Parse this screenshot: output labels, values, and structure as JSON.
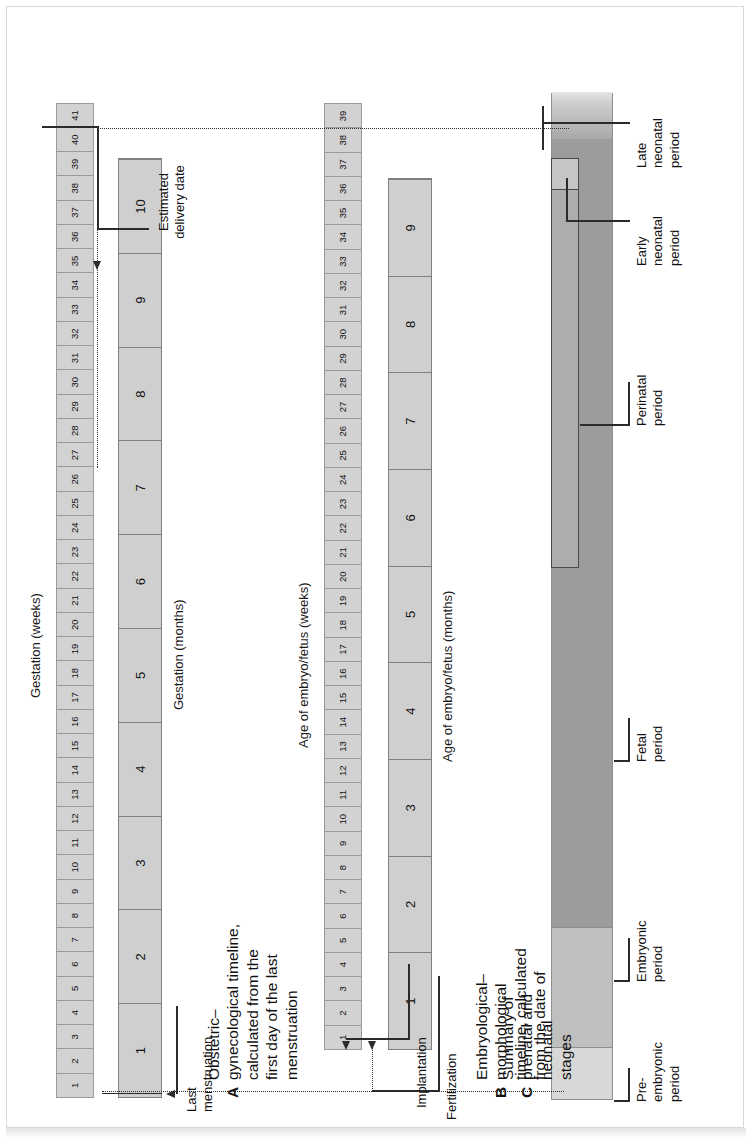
{
  "figure": {
    "title_a_letter": "A",
    "title_a": "Obstetric–\ngynecological timeline,\ncalculated from the\nfirst day of the last\nmenstruation",
    "title_b_letter": "B",
    "title_b": "Embryological–\nmorphological\ntimeline, calculated\nfrom the date of\nfertilization",
    "title_c_letter": "C",
    "title_c": "Summary of\nprenatal and\nneonatal\nstages"
  },
  "section_a": {
    "weeks_axis_label": "Gestation (weeks)",
    "months_axis_label": "Gestation (months)",
    "weeks": [
      "1",
      "2",
      "3",
      "4",
      "5",
      "6",
      "7",
      "8",
      "9",
      "10",
      "11",
      "12",
      "13",
      "14",
      "15",
      "16",
      "17",
      "18",
      "19",
      "20",
      "21",
      "22",
      "23",
      "24",
      "25",
      "26",
      "27",
      "28",
      "29",
      "30",
      "31",
      "32",
      "33",
      "34",
      "35",
      "36",
      "37",
      "38",
      "39",
      "40",
      "41"
    ],
    "months": [
      "1",
      "2",
      "3",
      "4",
      "5",
      "6",
      "7",
      "8",
      "9",
      "10"
    ],
    "callouts": {
      "last_menstruation": "Last\nmenstruation",
      "estimated_delivery": "Estimated\ndelivery date"
    }
  },
  "section_b": {
    "weeks_axis_label": "Age of embryo/fetus (weeks)",
    "months_axis_label": "Age of embryo/fetus (months)",
    "weeks": [
      "1",
      "2",
      "3",
      "4",
      "5",
      "6",
      "7",
      "8",
      "9",
      "10",
      "11",
      "12",
      "13",
      "14",
      "15",
      "16",
      "17",
      "18",
      "19",
      "20",
      "21",
      "22",
      "23",
      "24",
      "25",
      "26",
      "27",
      "28",
      "29",
      "30",
      "31",
      "32",
      "33",
      "34",
      "35",
      "36",
      "37",
      "38",
      "39"
    ],
    "months": [
      "1",
      "2",
      "3",
      "4",
      "5",
      "6",
      "7",
      "8",
      "9"
    ],
    "callouts": {
      "implantation": "Implantation",
      "fertilization": "Fertilization"
    }
  },
  "section_c": {
    "stages": [
      {
        "name": "pre-embryonic",
        "label": "Pre-\nembryonic\nperiod",
        "color": "#d8d8d8"
      },
      {
        "name": "embryonic",
        "label": "Embryonic\nperiod",
        "color": "#bcbcbc"
      },
      {
        "name": "fetal",
        "label": "Fetal\nperiod",
        "color": "#9a9a9a"
      },
      {
        "name": "perinatal",
        "label": "Perinatal\nperiod",
        "color": "#b4b4b4"
      },
      {
        "name": "early-neonatal",
        "label": "Early\nneonatal\nperiod",
        "color": "#c4c4c4"
      },
      {
        "name": "late-neonatal",
        "label": "Late\nneonatal\nperiod",
        "color": "#b8b8b8"
      }
    ]
  },
  "chart_data": {
    "type": "table",
    "series": [
      {
        "name": "Gestation (weeks)",
        "categories": [
          "1",
          "2",
          "3",
          "4",
          "5",
          "6",
          "7",
          "8",
          "9",
          "10",
          "11",
          "12",
          "13",
          "14",
          "15",
          "16",
          "17",
          "18",
          "19",
          "20",
          "21",
          "22",
          "23",
          "24",
          "25",
          "26",
          "27",
          "28",
          "29",
          "30",
          "31",
          "32",
          "33",
          "34",
          "35",
          "36",
          "37",
          "38",
          "39",
          "40",
          "41"
        ]
      },
      {
        "name": "Gestation (months)",
        "categories": [
          "1",
          "2",
          "3",
          "4",
          "5",
          "6",
          "7",
          "8",
          "9",
          "10"
        ]
      },
      {
        "name": "Age of embryo/fetus (weeks)",
        "categories": [
          "1",
          "2",
          "3",
          "4",
          "5",
          "6",
          "7",
          "8",
          "9",
          "10",
          "11",
          "12",
          "13",
          "14",
          "15",
          "16",
          "17",
          "18",
          "19",
          "20",
          "21",
          "22",
          "23",
          "24",
          "25",
          "26",
          "27",
          "28",
          "29",
          "30",
          "31",
          "32",
          "33",
          "34",
          "35",
          "36",
          "37",
          "38",
          "39"
        ]
      },
      {
        "name": "Age of embryo/fetus (months)",
        "categories": [
          "1",
          "2",
          "3",
          "4",
          "5",
          "6",
          "7",
          "8",
          "9"
        ]
      }
    ],
    "events": [
      {
        "label": "Last menstruation",
        "gestation_week": 1
      },
      {
        "label": "Fertilization",
        "gestation_week": 3,
        "embryo_week": 1
      },
      {
        "label": "Implantation",
        "gestation_week": 3
      },
      {
        "label": "Estimated delivery date",
        "gestation_week": 40,
        "embryo_week": 38
      }
    ],
    "stages": [
      {
        "name": "Pre-embryonic period",
        "start_embryo_week": 1,
        "end_embryo_week": 2
      },
      {
        "name": "Embryonic period",
        "start_embryo_week": 3,
        "end_embryo_week": 8
      },
      {
        "name": "Fetal period",
        "start_embryo_week": 9,
        "end_embryo_week": 38
      },
      {
        "name": "Perinatal period",
        "start_gestation_week": 22,
        "end_gestation_week": 41
      },
      {
        "name": "Early neonatal period",
        "note": "first 7 days after birth"
      },
      {
        "name": "Late neonatal period",
        "note": "day 8 to day 28 after birth"
      }
    ]
  }
}
